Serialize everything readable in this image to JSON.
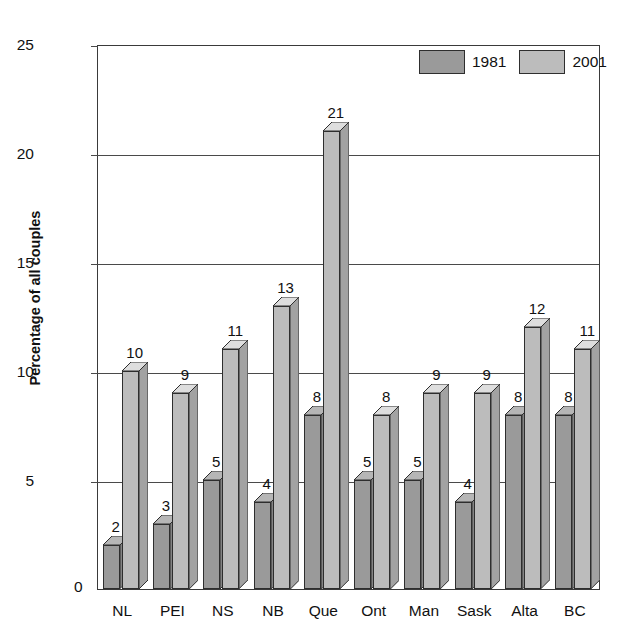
{
  "chart_data": {
    "type": "bar",
    "title": "",
    "subtitle": "",
    "xlabel": "",
    "ylabel": "Percentage of all couples",
    "ylim": [
      0,
      25
    ],
    "yticks": [
      0,
      5,
      10,
      15,
      20,
      25
    ],
    "grid": true,
    "legend_position": "top-right",
    "categories": [
      "NL",
      "PEI",
      "NS",
      "NB",
      "Que",
      "Ont",
      "Man",
      "Sask",
      "Alta",
      "BC"
    ],
    "series": [
      {
        "name": "1981",
        "color": "#9a9a9a",
        "values": [
          2,
          3,
          5,
          4,
          8,
          5,
          5,
          4,
          8,
          8
        ]
      },
      {
        "name": "2001",
        "color": "#bcbcbc",
        "values": [
          10,
          9,
          11,
          13,
          21,
          8,
          9,
          9,
          12,
          11
        ]
      }
    ]
  },
  "legend": {
    "items": [
      {
        "label": "1981"
      },
      {
        "label": "2001"
      }
    ]
  },
  "axis": {
    "zero_label": "0",
    "tick_labels": [
      "25",
      "20",
      "15",
      "10",
      "5"
    ]
  }
}
